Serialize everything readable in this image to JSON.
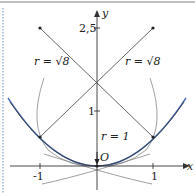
{
  "figure": {
    "axes": {
      "x_label": "x",
      "y_label": "y",
      "origin_label": "O"
    },
    "ticks": {
      "x": [
        "-1",
        "1"
      ],
      "y": [
        "1",
        "2,5"
      ]
    },
    "annotations": {
      "left_radius": "r = √8",
      "right_radius": "r = √8",
      "small_radius": "r = 1"
    },
    "colors": {
      "parabola": "#4a6fb5",
      "curve_dark": "#333333",
      "lines": "#555555",
      "circles": "#888888"
    }
  }
}
